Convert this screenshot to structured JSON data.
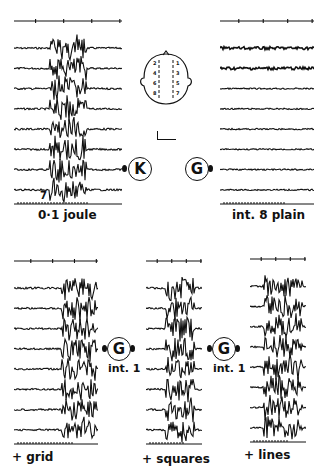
{
  "figure": {
    "type": "EEG recordings, 8 channels per panel",
    "colors": {
      "ink": "#111111",
      "background": "#ffffff"
    },
    "panels": [
      {
        "id": "a",
        "caption": "0·1 joule",
        "channel_marker": "7",
        "stimulus": "K",
        "burst": true,
        "position": "top-left"
      },
      {
        "id": "b",
        "caption": "int. 8 plain",
        "stimulus": "G",
        "burst": false,
        "position": "top-right"
      },
      {
        "id": "c",
        "caption": "+ grid",
        "stimulus": "G",
        "stimulus_label": "int. 1",
        "burst": true,
        "position": "bottom-left"
      },
      {
        "id": "d",
        "caption": "+ squares",
        "stimulus": "G",
        "stimulus_label": "int. 1",
        "burst": true,
        "position": "bottom-center"
      },
      {
        "id": "e",
        "caption": "+ lines",
        "burst": true,
        "position": "bottom-right"
      }
    ],
    "head_diagram": {
      "left_electrodes": [
        "2",
        "4",
        "6",
        "8"
      ],
      "right_electrodes": [
        "1",
        "3",
        "5",
        "7"
      ]
    },
    "scale_bar": "calibration"
  }
}
